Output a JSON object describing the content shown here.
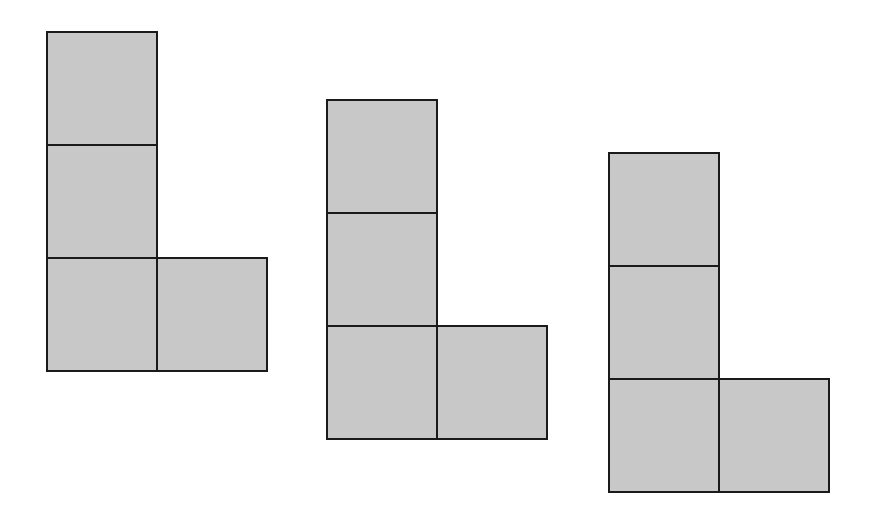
{
  "diagram": {
    "colors": {
      "fill": "#c8c8c8",
      "stroke": "#1a1a1a",
      "background": "#ffffff"
    },
    "cell_size": 112,
    "shapes": [
      {
        "name": "l-shape-1",
        "x": 46,
        "y": 31,
        "cells": [
          [
            0,
            0
          ],
          [
            0,
            1
          ],
          [
            0,
            2
          ],
          [
            1,
            2
          ]
        ]
      },
      {
        "name": "l-shape-2",
        "x": 326,
        "y": 99,
        "cells": [
          [
            0,
            0
          ],
          [
            0,
            1
          ],
          [
            0,
            2
          ],
          [
            1,
            2
          ]
        ]
      },
      {
        "name": "l-shape-3",
        "x": 608,
        "y": 152,
        "cells": [
          [
            0,
            0
          ],
          [
            0,
            1
          ],
          [
            0,
            2
          ],
          [
            1,
            2
          ]
        ]
      }
    ]
  }
}
